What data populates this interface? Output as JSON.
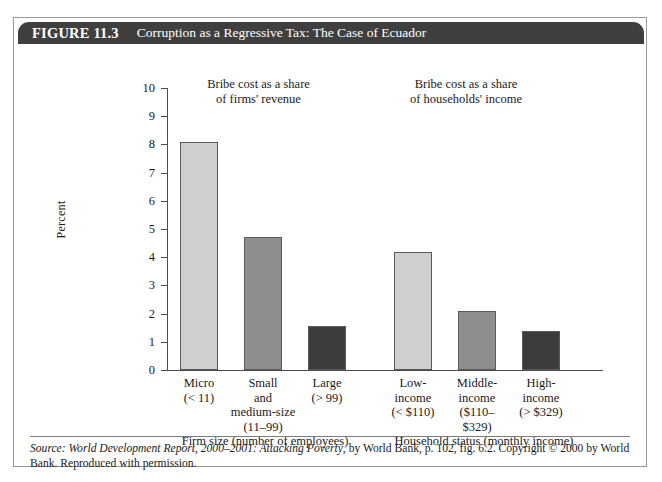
{
  "figure": {
    "number": "FIGURE 11.3",
    "title": "Corruption as a Regressive Tax: The Case of Ecuador"
  },
  "source_note": {
    "label": "Source:",
    "work_title": "World Development Report, 2000–2001: Attacking Poverty",
    "rest": ", by World Bank, p. 102, fig. 6.2. Copyright © 2000 by World Bank. Reproduced with permission."
  },
  "chart_data": {
    "type": "bar",
    "title": "Corruption as a Regressive Tax: The Case of Ecuador",
    "xlabel": "",
    "ylabel": "Percent",
    "ylim": [
      0,
      10
    ],
    "yticks": [
      0,
      1,
      2,
      3,
      4,
      5,
      6,
      7,
      8,
      9,
      10
    ],
    "grid": false,
    "legend": "none",
    "annotations": [
      "Bribe cost as a share\nof firms' revenue",
      "Bribe cost as a share\nof households' income"
    ],
    "group_labels": [
      "Firm size (number of employees)",
      "Household status (monthly income)"
    ],
    "categories": [
      "Micro\n(< 11)",
      "Small\nand\nmedium-size\n(11–99)",
      "Large\n(> 99)",
      "Low-\nincome\n(< $110)",
      "Middle-\nincome\n($110–\n$329)",
      "High-\nincome\n(> $329)"
    ],
    "values": [
      8.1,
      4.7,
      1.55,
      4.2,
      2.1,
      1.4
    ],
    "colors": [
      "#cfcfcf",
      "#8e8e8e",
      "#3c3c3c",
      "#cfcfcf",
      "#8e8e8e",
      "#3c3c3c"
    ]
  }
}
